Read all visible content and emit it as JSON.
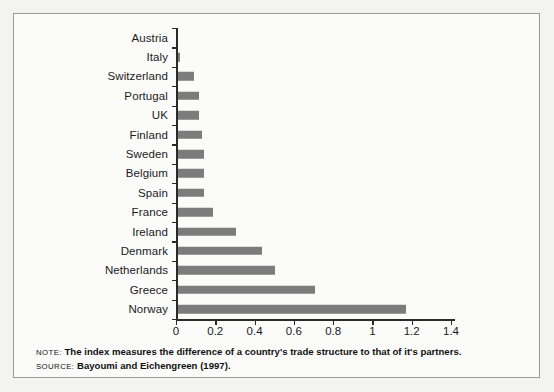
{
  "figure": {
    "note_tag": "NOTE:",
    "note_text": "The index measures the difference of a country's trade structure to that of it's partners.",
    "source_tag": "SOURCE:",
    "source_text": "Bayoumi and Eichengreen (1997).",
    "bar_color": "#7c7c7c",
    "axis_color": "#2a2a2a",
    "background": "#fbfbfa"
  },
  "chart_data": {
    "type": "bar",
    "orientation": "horizontal",
    "title": "",
    "xlabel": "",
    "ylabel": "",
    "xlim": [
      0,
      1.4
    ],
    "xticks": [
      0,
      0.2,
      0.4,
      0.6,
      0.8,
      1,
      1.2,
      1.4
    ],
    "xticklabels": [
      "0",
      "0.2",
      "0.4",
      "0.6",
      "0.8",
      "1",
      "1.2",
      "1.4"
    ],
    "grid": false,
    "legend": null,
    "categories": [
      "Austria",
      "Italy",
      "Switzerland",
      "Portugal",
      "UK",
      "Finland",
      "Sweden",
      "Belgium",
      "Spain",
      "France",
      "Ireland",
      "Denmark",
      "Netherlands",
      "Greece",
      "Norway"
    ],
    "values": [
      0.01,
      0.02,
      0.09,
      0.115,
      0.115,
      0.13,
      0.14,
      0.14,
      0.14,
      0.19,
      0.305,
      0.44,
      0.505,
      0.71,
      1.17
    ]
  }
}
